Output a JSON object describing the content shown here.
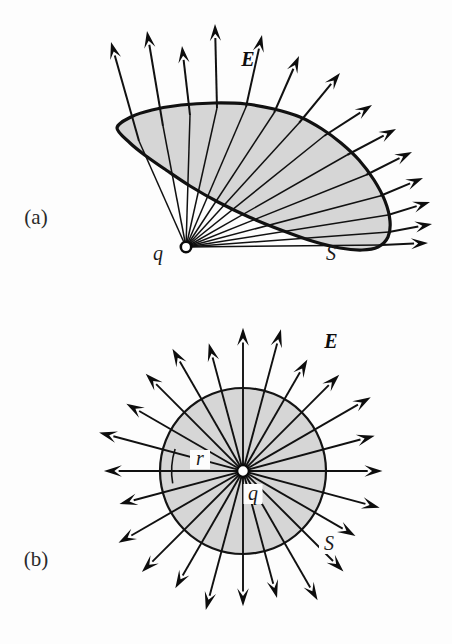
{
  "figure": {
    "background_color": "#fdfdfd",
    "surface_fill_color": "#d6d6d6",
    "line_color": "#111111",
    "width": 452,
    "height": 644
  },
  "panels": [
    {
      "id": "a",
      "label": "(a)",
      "label_x": 36,
      "label_y": 224,
      "description": "Electric field lines from a point charge passing through an arbitrary open surface S",
      "charge": {
        "symbol": "q",
        "label_x": 158,
        "label_y": 260,
        "x": 186,
        "y": 247,
        "marker": "open-circle",
        "marker_radius": 5.2
      },
      "surface": {
        "symbol": "S",
        "label_x": 331,
        "label_y": 260,
        "outline": [
          [
            117,
            128
          ],
          [
            131,
            117
          ],
          [
            152,
            110
          ],
          [
            181,
            105
          ],
          [
            214,
            103
          ],
          [
            246,
            104
          ],
          [
            274,
            109
          ],
          [
            300,
            117
          ],
          [
            322,
            129
          ],
          [
            341,
            143
          ],
          [
            359,
            160
          ],
          [
            374,
            180
          ],
          [
            385,
            201
          ],
          [
            390,
            221
          ],
          [
            388,
            237
          ],
          [
            378,
            247
          ],
          [
            362,
            250
          ],
          [
            340,
            248
          ],
          [
            312,
            241
          ],
          [
            281,
            230
          ],
          [
            249,
            217
          ],
          [
            218,
            202
          ],
          [
            190,
            186
          ],
          [
            166,
            170
          ],
          [
            146,
            156
          ],
          [
            130,
            143
          ]
        ]
      },
      "field_label": {
        "symbol": "E",
        "label_x": 248,
        "label_y": 66,
        "bold": true
      },
      "field_line_count": 18,
      "field_lines": [
        {
          "angle_deg": -112,
          "exit_x": 139,
          "exit_y": 141,
          "tip_x": 111,
          "tip_y": 42
        },
        {
          "angle_deg": -104,
          "exit_x": 163,
          "exit_y": 126,
          "tip_x": 147,
          "tip_y": 31
        },
        {
          "angle_deg": -97,
          "exit_x": 190,
          "exit_y": 115,
          "tip_x": 182,
          "tip_y": 46
        },
        {
          "angle_deg": -92,
          "exit_x": 217,
          "exit_y": 108,
          "tip_x": 215,
          "tip_y": 24
        },
        {
          "angle_deg": -82,
          "exit_x": 246,
          "exit_y": 107,
          "tip_x": 262,
          "tip_y": 35
        },
        {
          "angle_deg": -70,
          "exit_x": 274,
          "exit_y": 113,
          "tip_x": 299,
          "tip_y": 56
        },
        {
          "angle_deg": -58,
          "exit_x": 299,
          "exit_y": 123,
          "tip_x": 340,
          "tip_y": 73
        },
        {
          "angle_deg": -46,
          "exit_x": 324,
          "exit_y": 136,
          "tip_x": 372,
          "tip_y": 105
        },
        {
          "angle_deg": -36,
          "exit_x": 347,
          "exit_y": 155,
          "tip_x": 396,
          "tip_y": 129
        },
        {
          "angle_deg": -26,
          "exit_x": 366,
          "exit_y": 175,
          "tip_x": 412,
          "tip_y": 152
        },
        {
          "angle_deg": -16,
          "exit_x": 380,
          "exit_y": 196,
          "tip_x": 423,
          "tip_y": 178
        },
        {
          "angle_deg": -8,
          "exit_x": 388,
          "exit_y": 215,
          "tip_x": 430,
          "tip_y": 202
        },
        {
          "angle_deg": -2,
          "exit_x": 389,
          "exit_y": 232,
          "tip_x": 432,
          "tip_y": 224
        },
        {
          "angle_deg": 3,
          "exit_x": 382,
          "exit_y": 245,
          "tip_x": 428,
          "tip_y": 243
        }
      ]
    },
    {
      "id": "b",
      "label": "(b)",
      "label_x": 36,
      "label_y": 566,
      "description": "Spherical Gaussian surface S of radius r centered on point charge q with radial electric field",
      "charge": {
        "symbol": "q",
        "label_x": 253,
        "label_y": 500,
        "x": 243,
        "y": 471,
        "marker": "open-circle",
        "marker_radius": 6.0
      },
      "surface": {
        "symbol": "S",
        "label_x": 329,
        "label_y": 550,
        "center_x": 243,
        "center_y": 471,
        "radius": 83
      },
      "radius_label": {
        "symbol": "r",
        "label_x": 200,
        "label_y": 465
      },
      "field_label": {
        "symbol": "E",
        "label_x": 331,
        "label_y": 348,
        "bold": true
      },
      "field_line_count": 24,
      "field_line_angle_step_deg": 15,
      "field_line_tip_radius": 139,
      "field_line_start_radius": 7
    }
  ],
  "symbols": {
    "E": "E",
    "q": "q",
    "r": "r",
    "S": "S"
  }
}
